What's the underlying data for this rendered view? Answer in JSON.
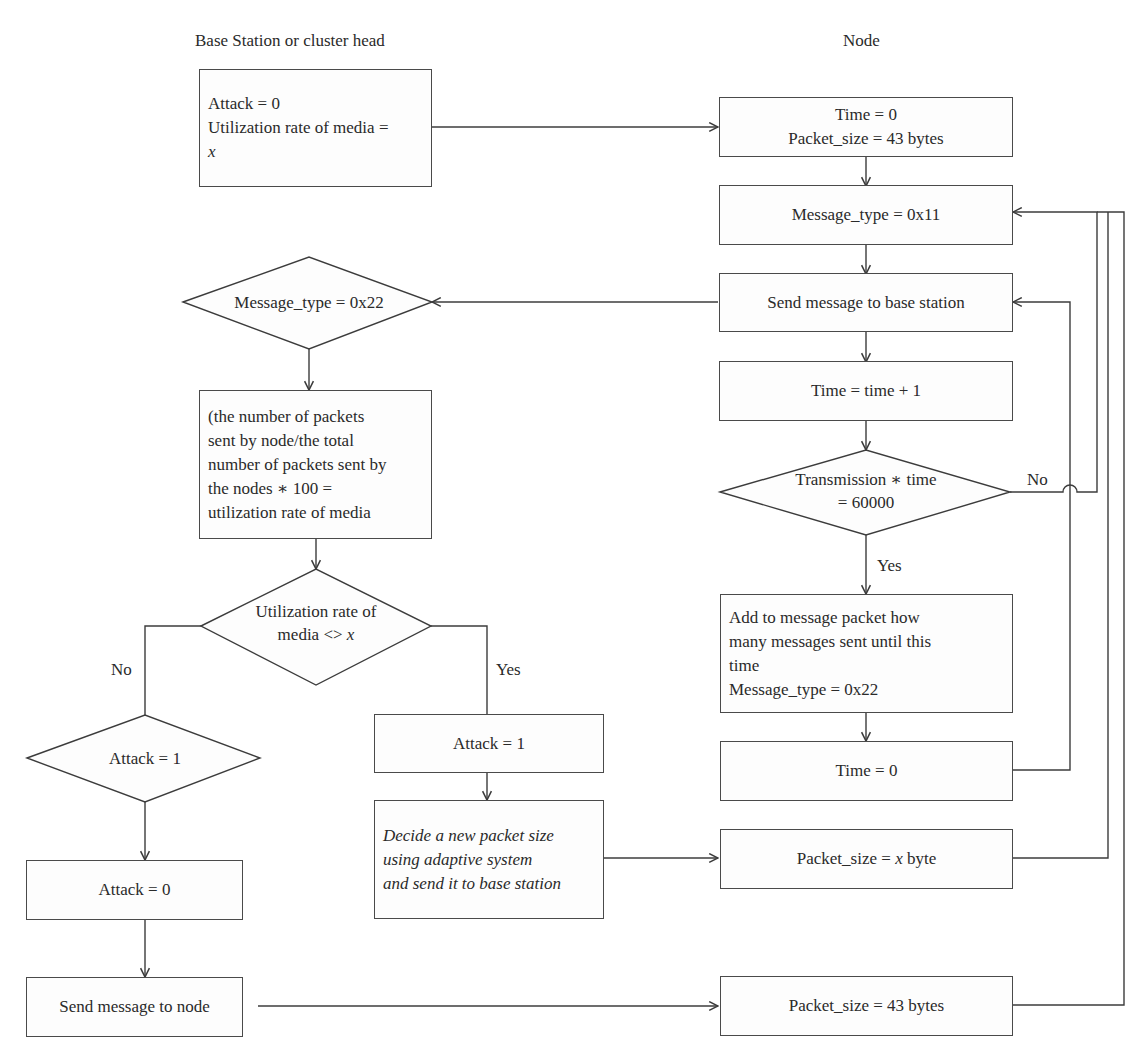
{
  "headers": {
    "base_station": "Base Station or cluster head",
    "node": "Node"
  },
  "base_station": {
    "init_box": {
      "line1": "Attack = 0",
      "line2": "Utilization rate of media =",
      "line3": "x"
    },
    "decision_msg_type": "Message_type = 0x22",
    "compute_box": [
      "(the number of packets",
      "sent by node/the total",
      "number of packets sent by",
      "the nodes ∗ 100 =",
      "utilization rate of media"
    ],
    "decision_util": {
      "line1": "Utilization rate of",
      "line2_prefix": "media <> ",
      "line2_var": "x"
    },
    "no_label": "No",
    "yes_label": "Yes",
    "decision_attack": "Attack = 1",
    "attack_set_one": "Attack = 1",
    "adaptive_box": [
      "Decide a new packet size",
      "using adaptive system",
      "and send it to base station"
    ],
    "attack_reset": "Attack = 0",
    "send_to_node": "Send message to node"
  },
  "node": {
    "init_box": {
      "line1": "Time = 0",
      "line2": "Packet_size = 43 bytes"
    },
    "msg_type_box": "Message_type = 0x11",
    "send_to_bs": "Send message to base station",
    "time_inc": "Time = time + 1",
    "decision_tx": {
      "line1": "Transmission ∗ time",
      "line2": "= 60000"
    },
    "no_label": "No",
    "yes_label": "Yes",
    "add_box": [
      "Add to message packet how",
      "many messages sent until this",
      "time",
      "Message_type = 0x22"
    ],
    "time_reset": "Time = 0",
    "packet_x": {
      "prefix": "Packet_size = ",
      "var": "x",
      "suffix": " byte"
    },
    "packet_43": "Packet_size = 43 bytes"
  },
  "colors": {
    "line": "#3c3c3c",
    "box_border": "#4a4a4a",
    "text": "#2a2a2a",
    "background": "#ffffff"
  }
}
